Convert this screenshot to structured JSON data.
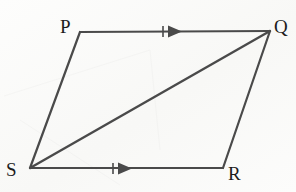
{
  "figure": {
    "caption": "Parallelogram PQRS with diagonal SQ",
    "background_color": "#fbfbfa",
    "stroke_color": "#4a4a4a",
    "label_color": "#1c1c1c",
    "stroke_width": 2.2,
    "watermark_text": "Network plays the ACHILLES",
    "vertices": [
      {
        "id": "P",
        "label": "P",
        "x": 80,
        "y": 32,
        "label_x": 60,
        "label_y": 17
      },
      {
        "id": "Q",
        "label": "Q",
        "x": 270,
        "y": 31,
        "label_x": 274,
        "label_y": 17
      },
      {
        "id": "R",
        "label": "R",
        "x": 223,
        "y": 168,
        "label_x": 228,
        "label_y": 164
      },
      {
        "id": "S",
        "label": "S",
        "x": 30,
        "y": 168,
        "label_x": 6,
        "label_y": 160
      }
    ],
    "edges": [
      {
        "id": "PQ",
        "from": "P",
        "to": "Q",
        "marked": true,
        "name": "edge-pq-top"
      },
      {
        "id": "QR",
        "from": "Q",
        "to": "R",
        "marked": false,
        "name": "edge-qr-right"
      },
      {
        "id": "SR",
        "from": "S",
        "to": "R",
        "marked": true,
        "name": "edge-sr-bottom"
      },
      {
        "id": "SP",
        "from": "S",
        "to": "P",
        "marked": false,
        "name": "edge-sp-left"
      }
    ],
    "diagonal": {
      "id": "SQ",
      "from": "S",
      "to": "Q",
      "name": "diagonal-sq"
    },
    "markers": [
      {
        "id": "marker-pq",
        "on_edge": "PQ",
        "type": "single-arrow-tick",
        "tick_x": 163,
        "arrow_x": 172,
        "y": 31
      },
      {
        "id": "marker-sr",
        "on_edge": "SR",
        "type": "single-arrow-tick",
        "tick_x": 113,
        "arrow_x": 122,
        "y": 169
      }
    ]
  }
}
